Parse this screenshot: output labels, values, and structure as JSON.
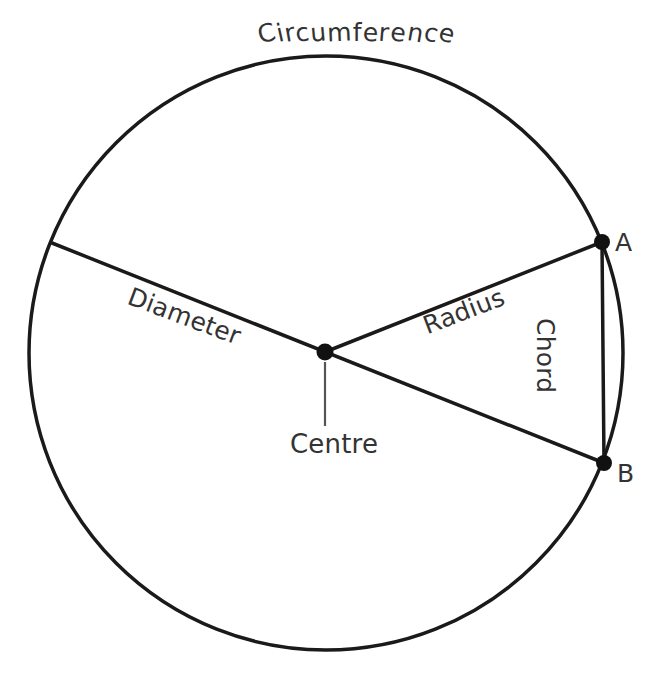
{
  "figure": {
    "background_color": "#ffffff",
    "stroke_color": "#1a1a1a",
    "text_color": "#333333"
  },
  "labels": {
    "circumference": "Circumference",
    "diameter": "Diameter",
    "radius": "Radius",
    "chord": "Chord",
    "centre": "Centre",
    "point_a": "A",
    "point_b": "B"
  },
  "geometry": {
    "circle": {
      "cx": 326,
      "cy": 353,
      "r": 297,
      "stroke_width": 3.5
    },
    "centre_point": {
      "x": 325,
      "y": 352,
      "dot_radius": 8
    },
    "point_a": {
      "x": 602,
      "y": 242,
      "dot_radius": 8
    },
    "point_b": {
      "x": 604,
      "y": 463,
      "dot_radius": 8
    },
    "diameter_line": {
      "x1": 52,
      "y1": 243,
      "x2": 604,
      "y2": 463
    },
    "radius_line": {
      "x1": 325,
      "y1": 352,
      "x2": 602,
      "y2": 242
    },
    "chord_line": {
      "x1": 602,
      "y1": 242,
      "x2": 604,
      "y2": 463
    },
    "centre_leader_line": {
      "x1": 325,
      "y1": 362,
      "x2": 325,
      "y2": 426
    }
  }
}
